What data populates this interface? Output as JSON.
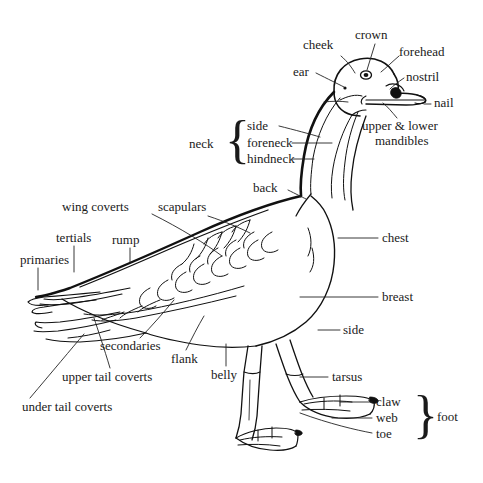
{
  "diagram": {
    "type": "anatomical-labeled-illustration",
    "line_color": "#111111",
    "background_color": "#ffffff",
    "labels": {
      "cheek": "cheek",
      "crown": "crown",
      "forehead": "forehead",
      "ear": "ear",
      "nostril": "nostril",
      "nail": "nail",
      "mandibles": "upper & lower",
      "mandibles2": "mandibles",
      "neck": "neck",
      "side_neck": "side",
      "foreneck": "foreneck",
      "hindneck": "hindneck",
      "back": "back",
      "scapulars": "scapulars",
      "wing_coverts": "wing coverts",
      "tertials": "tertials",
      "rump": "rump",
      "primaries": "primaries",
      "chest": "chest",
      "breast": "breast",
      "side": "side",
      "secondaries": "secondaries",
      "flank": "flank",
      "belly": "belly",
      "upper_tail_coverts": "upper tail coverts",
      "under_tail_coverts": "under tail coverts",
      "tarsus": "tarsus",
      "claw": "claw",
      "web": "web",
      "toe": "toe",
      "foot": "foot"
    },
    "braces": {
      "neck_brace": "{",
      "foot_brace": "}"
    }
  }
}
